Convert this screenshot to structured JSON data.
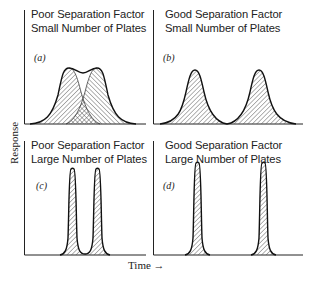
{
  "figure": {
    "y_axis_label": "Response",
    "x_axis_label": "Time →",
    "panels": [
      {
        "id": "a",
        "label": "(a)",
        "title_line1": "Poor Separation Factor",
        "title_line2": "Small Number of Plates",
        "separation": "poor",
        "plates": "small",
        "peaks": "overlapping broad"
      },
      {
        "id": "b",
        "label": "(b)",
        "title_line1": "Good Separation Factor",
        "title_line2": "Small Number of Plates",
        "separation": "good",
        "plates": "small",
        "peaks": "separated broad"
      },
      {
        "id": "c",
        "label": "(c)",
        "title_line1": "Poor Separation Factor",
        "title_line2": "Large Number of Plates",
        "separation": "poor",
        "plates": "large",
        "peaks": "close narrow"
      },
      {
        "id": "d",
        "label": "(d)",
        "title_line1": "Good Separation Factor",
        "title_line2": "Large Number of Plates",
        "separation": "good",
        "plates": "large",
        "peaks": "separated narrow"
      }
    ]
  },
  "colors": {
    "ink": "#1a1a1a",
    "hatch": "#444444",
    "background": "#ffffff"
  }
}
